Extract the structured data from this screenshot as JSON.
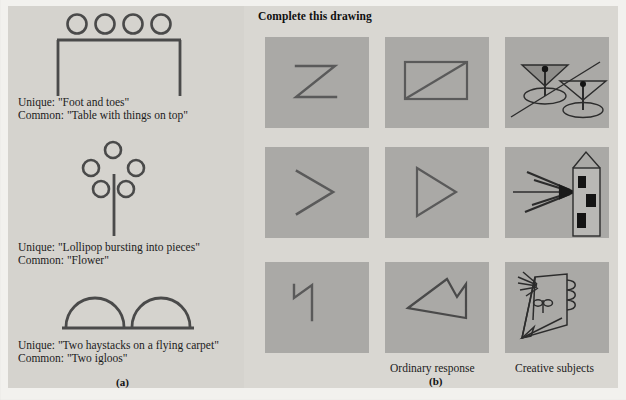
{
  "figure": {
    "panel_a_label": "(a)",
    "panel_b_label": "(b)",
    "panel_b_heading": "Complete this drawing",
    "column_labels": {
      "ordinary": "Ordinary response",
      "creative": "Creative subjects"
    }
  },
  "panel_a": {
    "items": [
      {
        "drawing": "four-circles-over-table",
        "unique": "Unique: \"Foot and toes\"",
        "common": "Common: \"Table with things on top\""
      },
      {
        "drawing": "five-circles-over-stem",
        "unique": "Unique: \"Lollipop bursting into pieces\"",
        "common": "Common: \"Flower\""
      },
      {
        "drawing": "two-semicircles-on-lines",
        "unique": "Unique: \"Two haystacks on a flying carpet\"",
        "common": "Common: \"Two igloos\""
      }
    ]
  },
  "panel_b": {
    "rows": [
      {
        "stimulus": "zigzag-z-stroke",
        "ordinary": "rectangle-with-diagonal",
        "creative": "two-martini-glasses-on-table"
      },
      {
        "stimulus": "open-chevron-stroke",
        "ordinary": "triangle-pointing-right",
        "creative": "arrow-striking-tower"
      },
      {
        "stimulus": "flag-hook-stroke",
        "ordinary": "angular-closed-polygon",
        "creative": "profile-face-with-hair"
      }
    ]
  },
  "colors": {
    "page_background": "#f2f1ee",
    "panel_a_background": "#d5d3ce",
    "panel_b_background": "#d9d7d2",
    "cell_background": "#aaa9a6",
    "stroke": "#3a3a3a",
    "text": "#1c1c1c"
  }
}
